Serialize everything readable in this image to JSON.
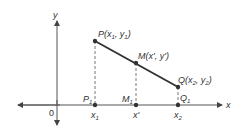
{
  "diagram": {
    "axes": {
      "x_label": "x",
      "y_label": "y",
      "origin_label": "0"
    },
    "points": {
      "P": {
        "label": "P(x",
        "sub1": "1",
        "mid": ", y",
        "sub2": "1",
        "end": ")"
      },
      "M": {
        "label": "M(x', y')"
      },
      "Q": {
        "label": "Q(x",
        "sub1": "2",
        "mid": ", y",
        "sub2": "2",
        "end": ")"
      }
    },
    "projections": {
      "P1": {
        "base": "P",
        "sub": "1"
      },
      "M1": {
        "base": "M",
        "sub": "1"
      },
      "Q1": {
        "base": "Q",
        "sub": "1"
      }
    },
    "ticks": {
      "x1": {
        "base": "x",
        "sub": "1"
      },
      "xprime": {
        "label": "x'"
      },
      "x2": {
        "base": "x",
        "sub": "2"
      }
    },
    "colors": {
      "line": "#333333",
      "dashed": "#555555",
      "text": "#333333"
    }
  }
}
